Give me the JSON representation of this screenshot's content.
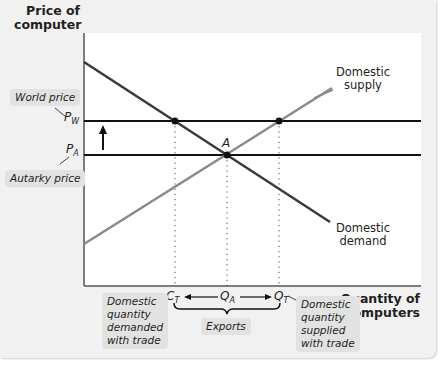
{
  "axes": {
    "y_title_line1": "Price of",
    "y_title_line2": "computer",
    "x_title_line1": "Quantity of",
    "x_title_line2": "computers"
  },
  "curves": {
    "supply_line1": "Domestic",
    "supply_line2": "supply",
    "demand_line1": "Domestic",
    "demand_line2": "demand"
  },
  "price_labels": {
    "world_price_tag": "World price",
    "pw_symbol": "P",
    "pw_sub": "W",
    "autarky_price_tag": "Autarky price",
    "pa_symbol": "P",
    "pa_sub": "A"
  },
  "points": {
    "equilibrium": "A"
  },
  "quantity_labels": {
    "ct_symbol": "C",
    "ct_sub": "T",
    "qa_symbol": "Q",
    "qa_sub": "A",
    "qt_symbol": "Q",
    "qt_sub": "T",
    "demanded_tag_lines": [
      "Domestic",
      "quantity",
      "demanded",
      "with trade"
    ],
    "supplied_tag_lines": [
      "Domestic",
      "quantity",
      "supplied",
      "with trade"
    ],
    "exports_tag": "Exports"
  },
  "colors": {
    "demand": "#3a3a3a",
    "supply": "#8a8a8a",
    "price_lines": "#111111",
    "panel_bg": "#f1f1f1",
    "tag_bg": "#e2e2e2"
  }
}
